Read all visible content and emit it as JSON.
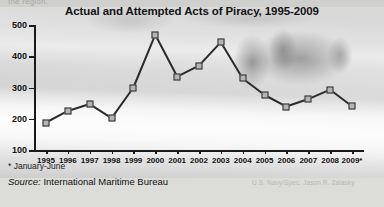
{
  "figure": {
    "title": "Actual and Attempted Acts of Piracy, 1995-2009",
    "truncated_text_above": "the region.",
    "footnote": "* January-June",
    "source_lead": "Source:",
    "source_name": "International Maritime Bureau",
    "photo_credit": "U.S. Navy/Spec. Jason R. Zalasky",
    "colors": {
      "line": "#2b2b2b",
      "marker_fill": "#b4b4b0",
      "marker_stroke": "#2b2b2b",
      "axis": "#1a1a1a",
      "text": "#111111",
      "background": "#d5d5d2"
    }
  },
  "chart_data": {
    "type": "line",
    "title": "Actual and Attempted Acts of Piracy, 1995-2009",
    "xlabel": "",
    "ylabel": "",
    "categories": [
      "1995",
      "1996",
      "1997",
      "1998",
      "1999",
      "2000",
      "2001",
      "2002",
      "2003",
      "2004",
      "2005",
      "2006",
      "2007",
      "2008",
      "2009*"
    ],
    "values": [
      188,
      225,
      247,
      202,
      300,
      469,
      335,
      370,
      445,
      329,
      276,
      239,
      263,
      293,
      240
    ],
    "series": [
      {
        "name": "Actual and attempted acts of piracy",
        "values": [
          188,
          225,
          247,
          202,
          300,
          469,
          335,
          370,
          445,
          329,
          276,
          239,
          263,
          293,
          240
        ]
      }
    ],
    "ylim": [
      100,
      500
    ],
    "yticks": [
      100,
      200,
      300,
      400,
      500
    ],
    "ytick_labels": [
      "100",
      "200",
      "300",
      "400",
      "500"
    ],
    "grid": false,
    "legend": "none",
    "marker": "square",
    "annotations": [
      "* January-June"
    ]
  }
}
